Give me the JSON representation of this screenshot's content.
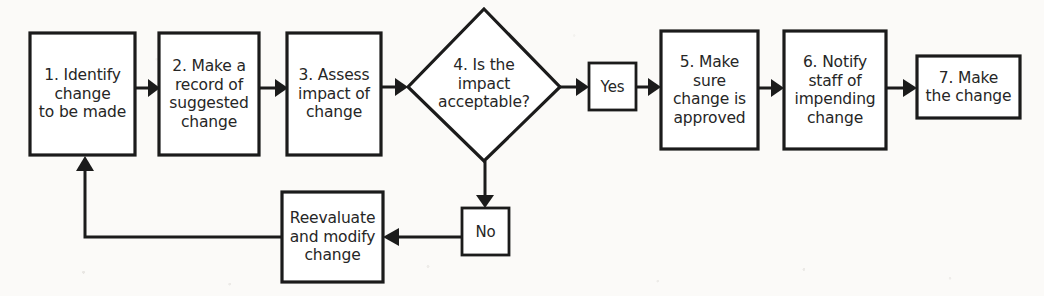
{
  "diagram": {
    "type": "flowchart",
    "background_color": "#fbfaf8",
    "line_color": "#1b1b1b",
    "node_fill": "#ffffff",
    "text_color": "#262626",
    "nodes": [
      {
        "id": "step1",
        "shape": "rectangle",
        "label": "1. Identify\nchange\nto be made",
        "x": 30,
        "y": 33,
        "w": 105,
        "h": 122
      },
      {
        "id": "step2",
        "shape": "rectangle",
        "label": "2. Make a\nrecord of\nsuggested\nchange",
        "x": 159,
        "y": 33,
        "w": 100,
        "h": 122
      },
      {
        "id": "step3",
        "shape": "rectangle",
        "label": "3. Assess\nimpact of\nchange",
        "x": 287,
        "y": 33,
        "w": 94,
        "h": 122
      },
      {
        "id": "step4",
        "shape": "diamond",
        "label": "4. Is the\nimpact\nacceptable?",
        "x": 408,
        "y": 9,
        "w": 152,
        "h": 152
      },
      {
        "id": "yes",
        "shape": "rectangle",
        "label": "Yes",
        "x": 589,
        "y": 63,
        "w": 47,
        "h": 47
      },
      {
        "id": "step5",
        "shape": "rectangle",
        "label": "5. Make\nsure\nchange is\napproved",
        "x": 661,
        "y": 31,
        "w": 97,
        "h": 118
      },
      {
        "id": "step6",
        "shape": "rectangle",
        "label": "6. Notify\nstaff of\nimpending\nchange",
        "x": 784,
        "y": 31,
        "w": 102,
        "h": 118
      },
      {
        "id": "step7",
        "shape": "rectangle",
        "label": "7. Make\nthe change",
        "x": 917,
        "y": 56,
        "w": 103,
        "h": 62
      },
      {
        "id": "no",
        "shape": "rectangle",
        "label": "No",
        "x": 462,
        "y": 208,
        "w": 47,
        "h": 47
      },
      {
        "id": "reevaluate",
        "shape": "rectangle",
        "label": "Reevaluate\nand modify\nchange",
        "x": 282,
        "y": 192,
        "w": 101,
        "h": 90
      }
    ],
    "edges": [
      {
        "id": "e1",
        "from": "step1",
        "to": "step2",
        "label": ""
      },
      {
        "id": "e2",
        "from": "step2",
        "to": "step3",
        "label": ""
      },
      {
        "id": "e3",
        "from": "step3",
        "to": "step4",
        "label": ""
      },
      {
        "id": "e4",
        "from": "step4",
        "to": "yes",
        "label": ""
      },
      {
        "id": "e5",
        "from": "yes",
        "to": "step5",
        "label": ""
      },
      {
        "id": "e6",
        "from": "step5",
        "to": "step6",
        "label": ""
      },
      {
        "id": "e7",
        "from": "step6",
        "to": "step7",
        "label": ""
      },
      {
        "id": "e8",
        "from": "step4",
        "to": "no",
        "label": ""
      },
      {
        "id": "e9",
        "from": "no",
        "to": "reevaluate",
        "label": ""
      },
      {
        "id": "e10",
        "from": "reevaluate",
        "to": "step1",
        "label": ""
      }
    ]
  }
}
